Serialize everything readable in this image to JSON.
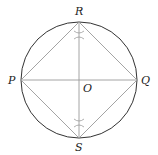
{
  "diagram": {
    "circle": {
      "cx": 79,
      "cy": 80,
      "r": 58,
      "stroke": "#333333"
    },
    "line_color": "#9a9a9a",
    "points": {
      "R": {
        "label": "R",
        "x": 79,
        "y": 22
      },
      "P": {
        "label": "P",
        "x": 21,
        "y": 80
      },
      "Q": {
        "label": "Q",
        "x": 137,
        "y": 80
      },
      "S": {
        "label": "S",
        "x": 79,
        "y": 138
      },
      "O": {
        "label": "O",
        "x": 79,
        "y": 80
      }
    },
    "labels": {
      "R": "R",
      "P": "P",
      "Q": "Q",
      "S": "S",
      "O": "O"
    },
    "segments": [
      "PQ",
      "RS",
      "PR",
      "RQ",
      "QS",
      "SP"
    ],
    "construction_marks": [
      {
        "x": 79,
        "y": 35
      },
      {
        "x": 79,
        "y": 123
      }
    ]
  }
}
